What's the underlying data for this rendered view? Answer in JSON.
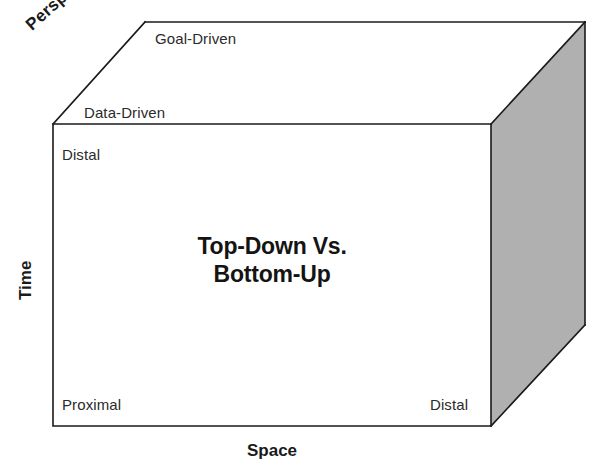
{
  "diagram": {
    "title_line1": "Top-Down Vs.",
    "title_line2": "Bottom-Up",
    "axes": {
      "vertical_label": "Time",
      "horizontal_label": "Space",
      "depth_label": "Perspective"
    },
    "depth_levels": {
      "far": "Goal-Driven",
      "near": "Data-Driven"
    },
    "time_levels": {
      "top": "Distal",
      "bottom": "Proximal"
    },
    "space_levels": {
      "left": "Proximal",
      "right": "Distal"
    },
    "labels": {
      "goal_driven": "Goal-Driven",
      "data_driven": "Data-Driven",
      "distal_time": "Distal",
      "proximal_time": "Proximal",
      "distal_space": "Distal"
    },
    "colors": {
      "side_face": "#b0b0b0",
      "front_face": "#ffffff",
      "edge": "#1a1a1a",
      "text": "#2b2b2b",
      "heading_text": "#141414"
    },
    "geometry": {
      "front_top_left": [
        53,
        124
      ],
      "front_top_right": [
        491,
        124
      ],
      "front_bottom_right": [
        491,
        426
      ],
      "front_bottom_left": [
        53,
        426
      ],
      "back_top_left": [
        145,
        22
      ],
      "back_top_right": [
        585,
        22
      ],
      "back_bottom_right": [
        585,
        325
      ]
    }
  }
}
